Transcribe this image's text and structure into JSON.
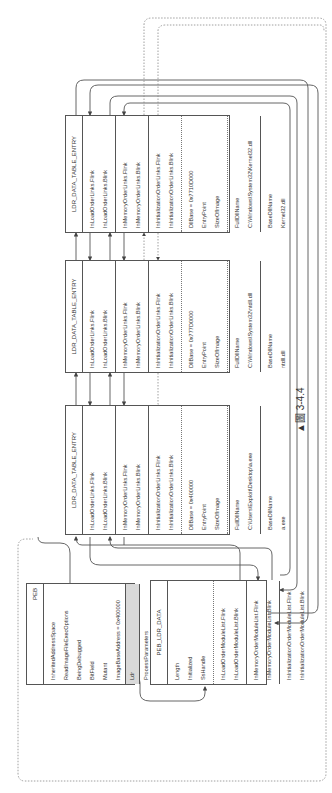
{
  "caption": "▲圖 3-4.4",
  "peb": {
    "title": "PEB",
    "fields": [
      "InheritedAddressSpace",
      "ReadImageFileExecOptions",
      "BeingDebugged",
      "BitField",
      "Mutant",
      "ImageBaseAddress = 0x400000"
    ],
    "ldr": "Ldr",
    "after": [
      "ProcessParameters"
    ]
  },
  "peb_ldr_data": {
    "title": "PEB_LDR_DATA",
    "fields": [
      "Length",
      "Initialized",
      "SsHandle"
    ],
    "load": [
      "InLoadOrderModuleList.Flink",
      "InLoadOrderModuleList.Blink"
    ],
    "memory": [
      "InMemoryOrderModuleList.Flink",
      "InMemoryOrderModuleList.Blink"
    ],
    "init": [
      "InInitializationOrderModuleList.Flink",
      "InInitializationOrderModuleList.Blink"
    ]
  },
  "entries": [
    {
      "title": "LDR_DATA_TABLE_ENTRY",
      "load": [
        "InLoadOrderLinks.Flink",
        "InLoadOrderLinks.Blink"
      ],
      "memory": [
        "InMemoryOrderLinks.Flink",
        "InMemoryOrderLinks.Blink"
      ],
      "init": [
        "InInitializationOrderLinks.Flink",
        "InInitializationOrderLinks.Blink"
      ],
      "dllbase": [
        "DllBase = 0x400000",
        "EntryPoint",
        "SizeOfImage"
      ],
      "full": [
        "FullDllName",
        "C:\\Users\\Exploit\\Desktop\\a.exe"
      ],
      "base": [
        "BaseDllName",
        "a.exe"
      ]
    },
    {
      "title": "LDR_DATA_TABLE_ENTRY",
      "load": [
        "InLoadOrderLinks.Flink",
        "InLoadOrderLinks.Blink"
      ],
      "memory": [
        "InMemoryOrderLinks.Flink",
        "InMemoryOrderLinks.Blink"
      ],
      "init": [
        "InInitializationOrderLinks.Flink",
        "InInitializationOrderLinks.Blink"
      ],
      "dllbase": [
        "DllBase = 0x777D0000",
        "EntryPoint",
        "SizeOfImage"
      ],
      "full": [
        "FullDllName",
        "C:\\Windows\\System32\\ntdll.dll"
      ],
      "base": [
        "BaseDllName",
        "ntdll.dll"
      ]
    },
    {
      "title": "LDR_DATA_TABLE_ENTRY",
      "load": [
        "InLoadOrderLinks.Flink",
        "InLoadOrderLinks.Blink"
      ],
      "memory": [
        "InMemoryOrderLinks.Flink",
        "InMemoryOrderLinks.Blink"
      ],
      "init": [
        "InInitializationOrderLinks.Flink",
        "InInitializationOrderLinks.Blink"
      ],
      "dllbase": [
        "DllBase = 0x7710D000",
        "EntryPoint",
        "SizeOfImage"
      ],
      "full": [
        "FullDllName",
        "C:\\Windows\\System32\\Kernel32.dll"
      ],
      "base": [
        "BaseDllName",
        "Kernel32.dll"
      ]
    }
  ]
}
